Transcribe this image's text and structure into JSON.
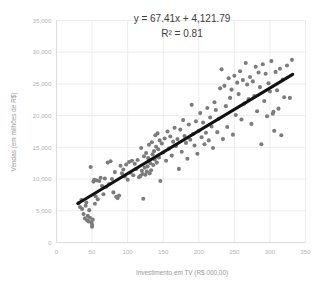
{
  "chart_data": {
    "type": "scatter",
    "title": "",
    "xlabel": "Investimento em TV (R$ 000,00)",
    "ylabel": "Vendas (em milhões de R$)",
    "xlim": [
      0,
      350
    ],
    "ylim": [
      0,
      35000
    ],
    "xticks": [
      "0",
      "50",
      "100",
      "150",
      "200",
      "250",
      "300",
      "350"
    ],
    "xtick_values": [
      0,
      50,
      100,
      150,
      200,
      250,
      300,
      350
    ],
    "yticks": [
      "0",
      "5,000",
      "10,000",
      "15,000",
      "20,000",
      "25,000",
      "30,000",
      "35,000"
    ],
    "ytick_values": [
      0,
      5000,
      10000,
      15000,
      20000,
      25000,
      30000,
      35000
    ],
    "grid": true,
    "legend": "none",
    "point_color": "#7c7c7c",
    "trendline_color": "#121212",
    "annotations": [
      "y = 67.41x + 4,121.79",
      "R² = 0.81"
    ],
    "regression": {
      "slope": 67.41,
      "intercept": 4121.79,
      "r_squared": 0.81,
      "x_start": 30,
      "x_end": 332
    },
    "series": [
      {
        "name": "Vendas x Investimento em TV",
        "points": [
          [
            31,
            6200
          ],
          [
            33,
            5600
          ],
          [
            35,
            6700
          ],
          [
            36,
            5300
          ],
          [
            38,
            4500
          ],
          [
            40,
            3800
          ],
          [
            41,
            5800
          ],
          [
            42,
            6300
          ],
          [
            43,
            3500
          ],
          [
            44,
            4200
          ],
          [
            45,
            3300
          ],
          [
            46,
            5100
          ],
          [
            47,
            3900
          ],
          [
            48,
            11900
          ],
          [
            49,
            3200
          ],
          [
            50,
            2500
          ],
          [
            50,
            2800
          ],
          [
            51,
            3600
          ],
          [
            52,
            9600
          ],
          [
            53,
            9900
          ],
          [
            54,
            6100
          ],
          [
            55,
            7300
          ],
          [
            56,
            9800
          ],
          [
            58,
            6800
          ],
          [
            60,
            9700
          ],
          [
            62,
            10200
          ],
          [
            64,
            8900
          ],
          [
            66,
            7600
          ],
          [
            68,
            10100
          ],
          [
            70,
            8800
          ],
          [
            72,
            12600
          ],
          [
            74,
            9200
          ],
          [
            76,
            12800
          ],
          [
            78,
            10000
          ],
          [
            80,
            7900
          ],
          [
            82,
            11100
          ],
          [
            84,
            7200
          ],
          [
            86,
            7000
          ],
          [
            88,
            7400
          ],
          [
            90,
            12100
          ],
          [
            92,
            10900
          ],
          [
            94,
            11500
          ],
          [
            96,
            10400
          ],
          [
            98,
            12300
          ],
          [
            100,
            9900
          ],
          [
            102,
            12700
          ],
          [
            104,
            11000
          ],
          [
            106,
            12900
          ],
          [
            108,
            10600
          ],
          [
            110,
            12400
          ],
          [
            112,
            11600
          ],
          [
            114,
            13000
          ],
          [
            116,
            10300
          ],
          [
            118,
            10500
          ],
          [
            119,
            14900
          ],
          [
            120,
            11300
          ],
          [
            121,
            10800
          ],
          [
            122,
            6900
          ],
          [
            123,
            13600
          ],
          [
            124,
            11800
          ],
          [
            125,
            10700
          ],
          [
            126,
            14100
          ],
          [
            127,
            11200
          ],
          [
            128,
            12000
          ],
          [
            129,
            13300
          ],
          [
            130,
            15400
          ],
          [
            131,
            10900
          ],
          [
            132,
            12500
          ],
          [
            133,
            11400
          ],
          [
            134,
            15800
          ],
          [
            135,
            13900
          ],
          [
            136,
            12200
          ],
          [
            137,
            14400
          ],
          [
            138,
            13100
          ],
          [
            139,
            16900
          ],
          [
            140,
            15100
          ],
          [
            141,
            12600
          ],
          [
            142,
            17200
          ],
          [
            143,
            14700
          ],
          [
            144,
            13400
          ],
          [
            145,
            16100
          ],
          [
            146,
            9700
          ],
          [
            148,
            15600
          ],
          [
            150,
            14200
          ],
          [
            152,
            16400
          ],
          [
            154,
            12900
          ],
          [
            156,
            17500
          ],
          [
            158,
            14800
          ],
          [
            160,
            16700
          ],
          [
            162,
            13700
          ],
          [
            164,
            15900
          ],
          [
            166,
            18100
          ],
          [
            168,
            15200
          ],
          [
            170,
            16300
          ],
          [
            172,
            11600
          ],
          [
            174,
            17800
          ],
          [
            176,
            14300
          ],
          [
            178,
            19300
          ],
          [
            180,
            16800
          ],
          [
            182,
            15700
          ],
          [
            184,
            13200
          ],
          [
            186,
            18600
          ],
          [
            188,
            16200
          ],
          [
            190,
            21700
          ],
          [
            192,
            17100
          ],
          [
            194,
            15300
          ],
          [
            196,
            19100
          ],
          [
            198,
            14000
          ],
          [
            200,
            17600
          ],
          [
            202,
            20400
          ],
          [
            204,
            16600
          ],
          [
            206,
            18900
          ],
          [
            208,
            15500
          ],
          [
            210,
            17300
          ],
          [
            212,
            21200
          ],
          [
            214,
            16100
          ],
          [
            216,
            19700
          ],
          [
            218,
            18300
          ],
          [
            220,
            14900
          ],
          [
            222,
            22100
          ],
          [
            224,
            20900
          ],
          [
            226,
            17400
          ],
          [
            228,
            19500
          ],
          [
            230,
            24300
          ],
          [
            232,
            27300
          ],
          [
            234,
            16300
          ],
          [
            236,
            24700
          ],
          [
            238,
            21500
          ],
          [
            240,
            18200
          ],
          [
            242,
            25900
          ],
          [
            244,
            22800
          ],
          [
            246,
            24100
          ],
          [
            248,
            17000
          ],
          [
            250,
            26300
          ],
          [
            252,
            20100
          ],
          [
            254,
            25200
          ],
          [
            256,
            23400
          ],
          [
            258,
            27000
          ],
          [
            260,
            19400
          ],
          [
            262,
            25600
          ],
          [
            264,
            21900
          ],
          [
            266,
            28300
          ],
          [
            268,
            24900
          ],
          [
            270,
            22600
          ],
          [
            272,
            26100
          ],
          [
            274,
            18700
          ],
          [
            276,
            25400
          ],
          [
            278,
            23100
          ],
          [
            280,
            27700
          ],
          [
            282,
            20700
          ],
          [
            284,
            26800
          ],
          [
            286,
            24500
          ],
          [
            288,
            15500
          ],
          [
            290,
            28100
          ],
          [
            292,
            22300
          ],
          [
            294,
            26600
          ],
          [
            296,
            19900
          ],
          [
            298,
            25100
          ],
          [
            300,
            23800
          ],
          [
            302,
            28600
          ],
          [
            304,
            20300
          ],
          [
            305,
            20600
          ],
          [
            306,
            17600
          ],
          [
            308,
            26900
          ],
          [
            310,
            24000
          ],
          [
            312,
            21100
          ],
          [
            314,
            27400
          ],
          [
            316,
            16900
          ],
          [
            318,
            25700
          ],
          [
            320,
            22900
          ],
          [
            324,
            27900
          ],
          [
            328,
            22800
          ],
          [
            331,
            28800
          ]
        ]
      }
    ]
  }
}
